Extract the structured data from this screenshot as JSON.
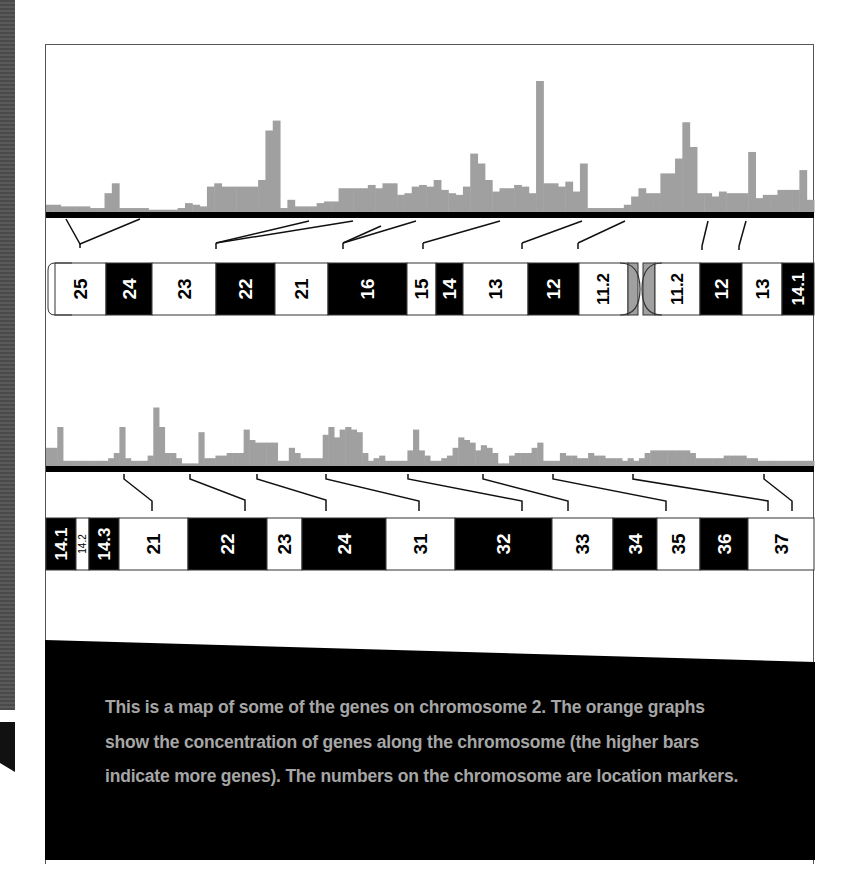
{
  "caption": {
    "text": "This is a map of some of the genes on chromosome 2. The orange graphs show the concentration of genes along the chromosome (the higher bars indicate more genes). The numbers on the chromosome are location markers."
  },
  "colors": {
    "histogram": "#a0a0a0",
    "dark_band": "#000000",
    "light_band": "#ffffff",
    "centromere": "#a0a0a0",
    "caption_bg": "#000000",
    "caption_text": "#a6a6a6"
  },
  "chart_data": [
    {
      "type": "bar",
      "title": "Gene density along chromosome 2 (upper segment, p-arm to q14.1)",
      "xlabel": "",
      "ylabel": "Gene concentration (relative)",
      "grid": false,
      "baseline_y": 213,
      "x_start": 46,
      "bin_width": 8.33,
      "values": [
        5,
        5,
        4,
        4,
        4,
        4,
        3,
        3,
        12,
        18,
        3,
        3,
        3,
        3,
        2,
        2,
        2,
        2,
        3,
        6,
        5,
        4,
        16,
        18,
        16,
        16,
        16,
        16,
        16,
        20,
        50,
        56,
        3,
        8,
        4,
        4,
        4,
        6,
        7,
        7,
        15,
        15,
        15,
        15,
        17,
        15,
        18,
        18,
        11,
        12,
        16,
        17,
        16,
        20,
        14,
        12,
        11,
        16,
        36,
        30,
        20,
        13,
        15,
        15,
        17,
        16,
        12,
        80,
        18,
        18,
        16,
        19,
        13,
        30,
        3,
        3,
        3,
        3,
        3,
        5,
        10,
        15,
        12,
        12,
        24,
        24,
        33,
        55,
        40,
        12,
        12,
        10,
        13,
        12,
        12,
        12,
        37,
        9,
        11,
        11,
        14,
        14,
        14,
        26,
        8
      ]
    },
    {
      "type": "bar",
      "title": "Gene density along chromosome 2 (lower segment, q14.1 to q37)",
      "xlabel": "",
      "ylabel": "Gene concentration (relative)",
      "grid": false,
      "baseline_y": 466,
      "x_start": 46,
      "bin_width": 8.33,
      "values": [
        14,
        14,
        30,
        4,
        4,
        4,
        4,
        4,
        4,
        4,
        4,
        6,
        10,
        30,
        6,
        4,
        4,
        4,
        8,
        45,
        30,
        10,
        10,
        6,
        2,
        2,
        2,
        26,
        6,
        6,
        8,
        8,
        10,
        10,
        10,
        28,
        20,
        18,
        18,
        18,
        18,
        4,
        4,
        14,
        10,
        6,
        6,
        6,
        6,
        24,
        30,
        22,
        28,
        30,
        28,
        26,
        10,
        4,
        6,
        8,
        4,
        4,
        4,
        4,
        12,
        28,
        12,
        8,
        4,
        4,
        6,
        8,
        14,
        22,
        20,
        18,
        12,
        16,
        14,
        10,
        2,
        2,
        8,
        10,
        10,
        10,
        14,
        18,
        4,
        4,
        4,
        10,
        8,
        8,
        6,
        6,
        10,
        8,
        8,
        6,
        6,
        6,
        4,
        6,
        4,
        6,
        10,
        12,
        12,
        12,
        12,
        12,
        12,
        12,
        10,
        6,
        6,
        6,
        6,
        6,
        8,
        8,
        8,
        8,
        6,
        6,
        4,
        4,
        4,
        4,
        4,
        4,
        4,
        4,
        4,
        4
      ]
    }
  ],
  "chromosome_top": {
    "bands": [
      {
        "label": "25",
        "x": 55,
        "w": 51,
        "dark": false,
        "cap": "left"
      },
      {
        "label": "24",
        "x": 106,
        "w": 46,
        "dark": true
      },
      {
        "label": "23",
        "x": 152,
        "w": 64,
        "dark": false
      },
      {
        "label": "22",
        "x": 216,
        "w": 59,
        "dark": true
      },
      {
        "label": "21",
        "x": 275,
        "w": 53,
        "dark": false
      },
      {
        "label": "16",
        "x": 328,
        "w": 79,
        "dark": true
      },
      {
        "label": "15",
        "x": 407,
        "w": 29,
        "dark": false
      },
      {
        "label": "14",
        "x": 436,
        "w": 27,
        "dark": true
      },
      {
        "label": "13",
        "x": 463,
        "w": 65,
        "dark": false
      },
      {
        "label": "12",
        "x": 528,
        "w": 51,
        "dark": true
      },
      {
        "label": "11.2",
        "x": 579,
        "w": 49,
        "dark": false,
        "small": true
      },
      {
        "label": "",
        "x": 628,
        "w": 10,
        "grey": true
      },
      {
        "label": "",
        "x": 643,
        "w": 12,
        "grey": true
      },
      {
        "label": "11.2",
        "x": 655,
        "w": 45,
        "dark": false,
        "small": true
      },
      {
        "label": "12",
        "x": 700,
        "w": 42,
        "dark": true
      },
      {
        "label": "13",
        "x": 742,
        "w": 40,
        "dark": false
      },
      {
        "label": "14.1",
        "x": 782,
        "w": 32,
        "dark": true,
        "small": true
      }
    ],
    "connectors": [
      [
        [
          66,
          219
        ],
        [
          80,
          244
        ],
        [
          140,
          219
        ]
      ],
      [
        [
          80,
          244
        ],
        [
          80,
          248
        ]
      ],
      [
        [
          216,
          243
        ],
        [
          309,
          221
        ]
      ],
      [
        [
          216,
          243
        ],
        [
          353,
          221
        ]
      ],
      [
        [
          216,
          243
        ],
        [
          216,
          249
        ]
      ],
      [
        [
          343,
          243
        ],
        [
          416,
          221
        ]
      ],
      [
        [
          343,
          243
        ],
        [
          381,
          226
        ]
      ],
      [
        [
          343,
          243
        ],
        [
          343,
          249
        ]
      ],
      [
        [
          423,
          243
        ],
        [
          500,
          221
        ]
      ],
      [
        [
          423,
          243
        ],
        [
          423,
          249
        ]
      ],
      [
        [
          522,
          243
        ],
        [
          582,
          221
        ]
      ],
      [
        [
          522,
          243
        ],
        [
          522,
          249
        ]
      ],
      [
        [
          578,
          243
        ],
        [
          625,
          221
        ]
      ],
      [
        [
          578,
          243
        ],
        [
          578,
          249
        ]
      ],
      [
        [
          708,
          221
        ],
        [
          702,
          246
        ]
      ],
      [
        [
          702,
          246
        ],
        [
          702,
          250
        ]
      ],
      [
        [
          746,
          221
        ],
        [
          739,
          246
        ]
      ],
      [
        [
          739,
          246
        ],
        [
          739,
          250
        ]
      ]
    ]
  },
  "chromosome_bottom": {
    "bands": [
      {
        "label": "14.1",
        "x": 46,
        "w": 30,
        "dark": true,
        "small": true
      },
      {
        "label": "14.2",
        "x": 76,
        "w": 13,
        "dark": false,
        "tiny": true
      },
      {
        "label": "14.3",
        "x": 89,
        "w": 30,
        "dark": true,
        "small": true
      },
      {
        "label": "21",
        "x": 119,
        "w": 69,
        "dark": false
      },
      {
        "label": "22",
        "x": 188,
        "w": 79,
        "dark": true
      },
      {
        "label": "23",
        "x": 267,
        "w": 35,
        "dark": false
      },
      {
        "label": "24",
        "x": 302,
        "w": 84,
        "dark": true
      },
      {
        "label": "31",
        "x": 386,
        "w": 69,
        "dark": false
      },
      {
        "label": "32",
        "x": 455,
        "w": 97,
        "dark": true
      },
      {
        "label": "33",
        "x": 552,
        "w": 61,
        "dark": false
      },
      {
        "label": "34",
        "x": 613,
        "w": 44,
        "dark": true
      },
      {
        "label": "35",
        "x": 657,
        "w": 43,
        "dark": false
      },
      {
        "label": "36",
        "x": 700,
        "w": 48,
        "dark": true
      },
      {
        "label": "37",
        "x": 748,
        "w": 66,
        "dark": false
      }
    ],
    "connectors": [
      [
        [
          124,
          474
        ],
        [
          124,
          479
        ],
        [
          152,
          501
        ],
        [
          152,
          511
        ]
      ],
      [
        [
          190,
          474
        ],
        [
          190,
          479
        ],
        [
          245,
          500
        ],
        [
          245,
          511
        ]
      ],
      [
        [
          257,
          474
        ],
        [
          257,
          479
        ],
        [
          326,
          500
        ],
        [
          326,
          511
        ]
      ],
      [
        [
          326,
          474
        ],
        [
          326,
          479
        ],
        [
          419,
          501
        ],
        [
          419,
          511
        ]
      ],
      [
        [
          408,
          474
        ],
        [
          408,
          479
        ],
        [
          522,
          501
        ],
        [
          522,
          511
        ]
      ],
      [
        [
          483,
          474
        ],
        [
          483,
          479
        ],
        [
          568,
          501
        ],
        [
          568,
          511
        ]
      ],
      [
        [
          553,
          474
        ],
        [
          553,
          479
        ],
        [
          666,
          501
        ],
        [
          666,
          511
        ]
      ],
      [
        [
          633,
          474
        ],
        [
          633,
          479
        ],
        [
          768,
          501
        ],
        [
          768,
          511
        ]
      ],
      [
        [
          764,
          474
        ],
        [
          764,
          479
        ],
        [
          792,
          501
        ],
        [
          792,
          511
        ]
      ]
    ]
  }
}
